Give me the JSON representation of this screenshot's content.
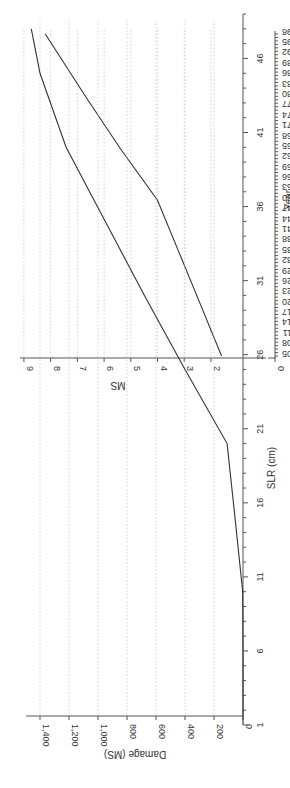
{
  "page": {
    "orientation": "rotated-90-clockwise"
  },
  "chart_data": [
    {
      "type": "line",
      "title": "",
      "xlabel": "Year",
      "ylabel": "MS",
      "x_tick_labels": [
        "2005",
        "2008",
        "2011",
        "2014",
        "2017",
        "2020",
        "2023",
        "2026",
        "2029",
        "2032",
        "2035",
        "2038",
        "2041",
        "2044",
        "2047",
        "2050",
        "2053",
        "2056",
        "2059",
        "2062",
        "2065",
        "2068",
        "2071",
        "2074",
        "2077",
        "2080",
        "2083",
        "2086",
        "2089",
        "2092",
        "2095",
        "2098"
      ],
      "y_tick_labels": [
        "0",
        "2",
        "3",
        "4",
        "5",
        "6",
        "7",
        "8",
        "9"
      ],
      "ylim": [
        0,
        9
      ],
      "y_axis_break": true,
      "grid": "horizontal dotted",
      "series": [
        {
          "name": "MS",
          "x": [
            2005,
            2020,
            2035,
            2050,
            2065,
            2080,
            2098
          ],
          "values": [
            1.6,
            2.4,
            3.2,
            4.0,
            5.4,
            6.7,
            8.2
          ]
        }
      ]
    },
    {
      "type": "line",
      "title": "",
      "xlabel": "SLR (cm)",
      "ylabel": "Damage (MS)",
      "x_tick_labels": [
        "1",
        "6",
        "11",
        "16",
        "21",
        "26",
        "31",
        "36",
        "41",
        "46"
      ],
      "y_tick_labels": [
        "0",
        "200",
        "400",
        "600",
        "800",
        "1,000",
        "1,200",
        "1,400"
      ],
      "ylim": [
        0,
        1500
      ],
      "grid": "horizontal dotted",
      "series": [
        {
          "name": "Damage",
          "x": [
            1,
            6,
            10,
            15,
            20,
            25,
            30,
            35,
            40,
            45,
            48
          ],
          "values": [
            0,
            0,
            2,
            55,
            110,
            400,
            680,
            950,
            1220,
            1400,
            1460
          ]
        }
      ]
    }
  ],
  "charts": {
    "top": {
      "xlabel": "Year",
      "ylabel": "MS",
      "y_ticks": [
        {
          "label": "9",
          "v": 9
        },
        {
          "label": "8",
          "v": 8
        },
        {
          "label": "7",
          "v": 7
        },
        {
          "label": "6",
          "v": 6
        },
        {
          "label": "5",
          "v": 5
        },
        {
          "label": "4",
          "v": 4
        },
        {
          "label": "3",
          "v": 3
        },
        {
          "label": "2",
          "v": 2
        },
        {
          "label": "0",
          "v": 0
        }
      ],
      "x_ticks": [
        "2005",
        "2008",
        "2011",
        "2014",
        "2017",
        "2020",
        "2023",
        "2026",
        "2029",
        "2032",
        "2035",
        "2038",
        "2041",
        "2044",
        "2047",
        "2050",
        "2053",
        "2056",
        "2059",
        "2062",
        "2065",
        "2068",
        "2071",
        "2074",
        "2077",
        "2080",
        "2083",
        "2086",
        "2089",
        "2092",
        "2095",
        "2098"
      ]
    },
    "bottom": {
      "xlabel": "SLR (cm)",
      "ylabel": "Damage (MS)",
      "y_ticks": [
        "0",
        "200",
        "400",
        "600",
        "800",
        "1,000",
        "1,200",
        "1,400"
      ],
      "x_ticks": [
        "1",
        "6",
        "11",
        "16",
        "21",
        "26",
        "31",
        "36",
        "41",
        "46"
      ]
    }
  }
}
